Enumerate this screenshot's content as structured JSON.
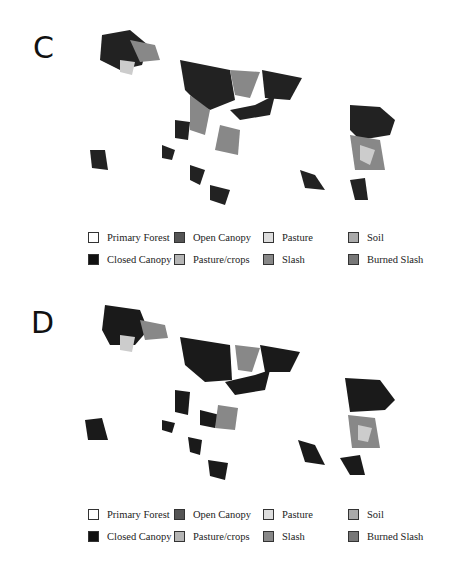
{
  "figure": {
    "panels": [
      {
        "label": "C"
      },
      {
        "label": "D"
      }
    ],
    "legend": [
      {
        "name": "Primary Forest",
        "color": "#ffffff"
      },
      {
        "name": "Open Canopy",
        "color": "#555555"
      },
      {
        "name": "Pasture",
        "color": "#dddddd"
      },
      {
        "name": "Soil",
        "color": "#aaaaaa"
      },
      {
        "name": "Closed Canopy",
        "color": "#111111"
      },
      {
        "name": "Pasture/crops",
        "color": "#b5b5b5"
      },
      {
        "name": "Slash",
        "color": "#888888"
      },
      {
        "name": "Burned Slash",
        "color": "#777777"
      }
    ]
  }
}
